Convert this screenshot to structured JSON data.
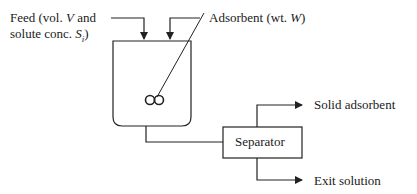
{
  "diagram": {
    "feed": {
      "line1_prefix": "Feed (vol. ",
      "line1_var": "V",
      "line1_suffix": " and",
      "line2_prefix": "solute conc. ",
      "line2_var": "S",
      "line2_sub": "i",
      "line2_suffix": ")"
    },
    "adsorbent": {
      "prefix": "Adsorbent (wt. ",
      "var": "W",
      "suffix": ")"
    },
    "tank": {
      "label": "Stirred tank",
      "impeller_symbol": "∞"
    },
    "separator": {
      "label": "Separator"
    },
    "outputs": {
      "solid": "Solid adsorbent",
      "exit": "Exit solution"
    },
    "colors": {
      "line": "#222222",
      "text": "#1a1a1a",
      "background": "#ffffff"
    }
  }
}
